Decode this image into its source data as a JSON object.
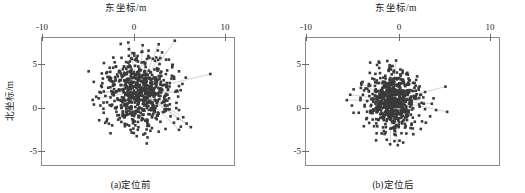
{
  "figure": {
    "panels": [
      {
        "id": "a",
        "caption": "(a)定位前",
        "x_axis_title": "东坐标/m",
        "y_axis_title": "北坐标/m",
        "x_ticks": [
          "-10",
          "0",
          "10"
        ],
        "y_ticks": [
          "5",
          "0",
          "-5"
        ]
      },
      {
        "id": "b",
        "caption": "(b)定位后",
        "x_axis_title": "东坐标/m",
        "y_axis_title": "北坐标/m",
        "x_ticks": [
          "-10",
          "0",
          "10"
        ],
        "y_ticks": [
          "5",
          "0",
          "-5"
        ]
      }
    ]
  },
  "chart_data": [
    {
      "type": "scatter",
      "title": "(a)定位前",
      "xlabel": "东坐标/m",
      "ylabel": "北坐标/m",
      "xlim": [
        -10,
        12.7
      ],
      "ylim": [
        -7.2,
        6.9
      ],
      "xticks": [
        -10,
        0,
        10
      ],
      "yticks": [
        -5,
        0,
        5
      ],
      "grid": false,
      "legend": null,
      "marker": "square",
      "marker_color": "#3a3a3a",
      "marker_size_px": 2.6,
      "connector_color": "#b4b4b4",
      "n_points": 620,
      "cluster": {
        "center_x": 1.4,
        "center_y": 0.9,
        "sigma_x": 1.9,
        "sigma_y": 2.0,
        "note": "dense elongated blob, slightly right and above origin"
      },
      "points": [
        [
          0.2,
          6.4
        ],
        [
          1.9,
          6.1
        ],
        [
          3.8,
          6.2
        ],
        [
          5.7,
          6.6
        ],
        [
          2.6,
          5.5
        ],
        [
          4.2,
          5.3
        ],
        [
          0.9,
          5.2
        ],
        [
          -0.6,
          4.7
        ],
        [
          1.3,
          4.9
        ],
        [
          3.1,
          4.6
        ],
        [
          5.0,
          4.5
        ],
        [
          -1.4,
          4.2
        ],
        [
          0.4,
          4.3
        ],
        [
          2.2,
          4.1
        ],
        [
          3.9,
          4.0
        ],
        [
          5.4,
          3.9
        ],
        [
          -2.0,
          3.6
        ],
        [
          -0.3,
          3.7
        ],
        [
          1.5,
          3.5
        ],
        [
          3.3,
          3.4
        ],
        [
          4.8,
          3.3
        ],
        [
          6.2,
          3.2
        ],
        [
          9.9,
          2.9
        ],
        [
          -2.4,
          3.0
        ],
        [
          -0.9,
          3.1
        ],
        [
          0.8,
          2.9
        ],
        [
          2.5,
          2.8
        ],
        [
          4.1,
          2.7
        ],
        [
          5.6,
          2.6
        ],
        [
          7.0,
          2.5
        ],
        [
          -2.8,
          2.4
        ],
        [
          -1.3,
          2.3
        ],
        [
          0.3,
          2.2
        ],
        [
          2.0,
          2.1
        ],
        [
          3.6,
          2.0
        ],
        [
          5.1,
          1.9
        ],
        [
          6.6,
          1.8
        ],
        [
          -3.0,
          1.6
        ],
        [
          -1.6,
          1.7
        ],
        [
          0.0,
          1.5
        ],
        [
          1.7,
          1.4
        ],
        [
          3.3,
          1.3
        ],
        [
          4.9,
          1.2
        ],
        [
          6.4,
          1.1
        ],
        [
          -3.2,
          0.9
        ],
        [
          -1.8,
          1.0
        ],
        [
          -0.2,
          0.8
        ],
        [
          1.4,
          0.7
        ],
        [
          3.0,
          0.6
        ],
        [
          4.6,
          0.5
        ],
        [
          6.1,
          0.4
        ],
        [
          -3.3,
          0.2
        ],
        [
          -1.9,
          0.3
        ],
        [
          -0.4,
          0.1
        ],
        [
          1.2,
          0.0
        ],
        [
          2.8,
          -0.1
        ],
        [
          4.4,
          -0.2
        ],
        [
          5.9,
          -0.3
        ],
        [
          -3.1,
          -0.6
        ],
        [
          -1.7,
          -0.5
        ],
        [
          -0.1,
          -0.7
        ],
        [
          1.5,
          -0.8
        ],
        [
          3.1,
          -0.9
        ],
        [
          4.7,
          -1.0
        ],
        [
          6.2,
          -1.1
        ],
        [
          -2.7,
          -1.4
        ],
        [
          -1.2,
          -1.3
        ],
        [
          0.4,
          -1.5
        ],
        [
          2.0,
          -1.6
        ],
        [
          3.6,
          -1.7
        ],
        [
          5.2,
          -1.8
        ],
        [
          6.7,
          -1.9
        ],
        [
          -2.3,
          -2.1
        ],
        [
          -0.8,
          -2.0
        ],
        [
          0.8,
          -2.2
        ],
        [
          2.4,
          -2.3
        ],
        [
          4.0,
          -2.4
        ],
        [
          5.6,
          -2.5
        ],
        [
          7.1,
          -2.6
        ],
        [
          -1.7,
          -2.8
        ],
        [
          -0.2,
          -2.9
        ],
        [
          1.4,
          -3.0
        ],
        [
          3.0,
          -3.1
        ],
        [
          4.6,
          -3.2
        ],
        [
          6.2,
          -3.3
        ],
        [
          7.6,
          -3.0
        ],
        [
          0.6,
          -3.6
        ],
        [
          2.2,
          -3.7
        ],
        [
          3.8,
          -3.5
        ],
        [
          1.2,
          -4.0
        ]
      ],
      "connectors": [
        [
          [
            1.5,
            1.0
          ],
          [
            0.2,
            6.4
          ]
        ],
        [
          [
            1.5,
            1.0
          ],
          [
            1.9,
            6.1
          ]
        ],
        [
          [
            1.5,
            1.0
          ],
          [
            3.8,
            6.2
          ]
        ],
        [
          [
            1.5,
            1.0
          ],
          [
            5.7,
            6.6
          ]
        ],
        [
          [
            1.5,
            1.0
          ],
          [
            9.9,
            2.9
          ]
        ],
        [
          [
            1.5,
            1.0
          ],
          [
            7.6,
            -3.0
          ]
        ],
        [
          [
            1.5,
            1.0
          ],
          [
            7.1,
            -2.6
          ]
        ],
        [
          [
            1.5,
            1.0
          ],
          [
            6.7,
            -1.9
          ]
        ],
        [
          [
            1.5,
            1.0
          ],
          [
            6.2,
            -3.3
          ]
        ],
        [
          [
            1.5,
            1.0
          ],
          [
            -3.3,
            0.2
          ]
        ],
        [
          [
            1.5,
            1.0
          ],
          [
            4.2,
            5.3
          ]
        ],
        [
          [
            1.5,
            1.0
          ],
          [
            2.6,
            5.5
          ]
        ]
      ]
    },
    {
      "type": "scatter",
      "title": "(b)定位后",
      "xlabel": "东坐标/m",
      "ylabel": "北坐标/m",
      "xlim": [
        -10,
        12.7
      ],
      "ylim": [
        -7.2,
        6.9
      ],
      "xticks": [
        -10,
        0,
        10
      ],
      "yticks": [
        -5,
        0,
        5
      ],
      "grid": false,
      "legend": null,
      "marker": "square",
      "marker_color": "#3a3a3a",
      "marker_size_px": 2.6,
      "connector_color": "#b4b4b4",
      "n_points": 620,
      "cluster": {
        "center_x": 0.1,
        "center_y": 0.0,
        "sigma_x": 1.35,
        "sigma_y": 1.5,
        "note": "tighter roughly circular blob centred on origin"
      },
      "points": [
        [
          0.6,
          4.4
        ],
        [
          -0.2,
          3.6
        ],
        [
          1.1,
          3.4
        ],
        [
          -1.3,
          3.0
        ],
        [
          0.3,
          3.1
        ],
        [
          1.8,
          2.9
        ],
        [
          -2.2,
          2.4
        ],
        [
          -0.9,
          2.5
        ],
        [
          0.7,
          2.3
        ],
        [
          2.2,
          2.2
        ],
        [
          -3.5,
          1.9
        ],
        [
          -2.6,
          1.8
        ],
        [
          -1.4,
          1.9
        ],
        [
          0.1,
          1.8
        ],
        [
          1.6,
          1.7
        ],
        [
          2.9,
          1.6
        ],
        [
          -4.4,
          1.2
        ],
        [
          -3.0,
          1.3
        ],
        [
          -1.8,
          1.2
        ],
        [
          -0.3,
          1.1
        ],
        [
          1.2,
          1.0
        ],
        [
          2.6,
          1.0
        ],
        [
          4.0,
          0.9
        ],
        [
          6.4,
          1.5
        ],
        [
          -4.8,
          0.6
        ],
        [
          -3.3,
          0.6
        ],
        [
          -1.9,
          0.5
        ],
        [
          -0.5,
          0.5
        ],
        [
          1.0,
          0.4
        ],
        [
          2.4,
          0.4
        ],
        [
          3.8,
          0.3
        ],
        [
          5.0,
          0.2
        ],
        [
          -5.2,
          0.0
        ],
        [
          -3.6,
          0.0
        ],
        [
          -2.1,
          -0.1
        ],
        [
          -0.7,
          -0.1
        ],
        [
          0.8,
          -0.2
        ],
        [
          2.2,
          -0.2
        ],
        [
          3.6,
          -0.3
        ],
        [
          4.8,
          -0.4
        ],
        [
          -4.6,
          -0.6
        ],
        [
          -3.1,
          -0.7
        ],
        [
          -1.7,
          -0.7
        ],
        [
          -0.3,
          -0.8
        ],
        [
          1.2,
          -0.8
        ],
        [
          2.6,
          -0.9
        ],
        [
          4.0,
          -1.0
        ],
        [
          5.3,
          -1.1
        ],
        [
          6.6,
          -1.3
        ],
        [
          -3.8,
          -1.4
        ],
        [
          -2.4,
          -1.4
        ],
        [
          -1.0,
          -1.5
        ],
        [
          0.5,
          -1.5
        ],
        [
          1.9,
          -1.6
        ],
        [
          3.3,
          -1.7
        ],
        [
          4.6,
          -1.8
        ],
        [
          -2.9,
          -2.1
        ],
        [
          -1.5,
          -2.2
        ],
        [
          0.0,
          -2.2
        ],
        [
          1.4,
          -2.3
        ],
        [
          2.8,
          -2.4
        ],
        [
          4.1,
          -2.5
        ],
        [
          -2.0,
          -2.9
        ],
        [
          -0.6,
          -3.0
        ],
        [
          0.9,
          -3.0
        ],
        [
          2.3,
          -3.1
        ],
        [
          3.5,
          -3.2
        ],
        [
          -1.1,
          -3.7
        ],
        [
          0.4,
          -3.8
        ],
        [
          1.8,
          -3.7
        ],
        [
          -0.5,
          -4.4
        ],
        [
          1.0,
          -4.5
        ],
        [
          -0.1,
          -4.9
        ],
        [
          0.8,
          -5.0
        ]
      ],
      "connectors": [
        [
          [
            0.1,
            0.0
          ],
          [
            0.6,
            4.4
          ]
        ],
        [
          [
            0.1,
            0.0
          ],
          [
            6.4,
            1.5
          ]
        ],
        [
          [
            0.1,
            0.0
          ],
          [
            6.6,
            -1.3
          ]
        ],
        [
          [
            0.1,
            0.0
          ],
          [
            -5.2,
            0.0
          ]
        ],
        [
          [
            0.1,
            0.0
          ],
          [
            -4.8,
            0.6
          ]
        ],
        [
          [
            0.1,
            0.0
          ],
          [
            0.8,
            -5.0
          ]
        ],
        [
          [
            0.1,
            0.0
          ],
          [
            -0.1,
            -4.9
          ]
        ],
        [
          [
            0.1,
            0.0
          ],
          [
            -3.5,
            1.9
          ]
        ],
        [
          [
            0.1,
            0.0
          ],
          [
            4.8,
            -0.4
          ]
        ]
      ]
    }
  ]
}
